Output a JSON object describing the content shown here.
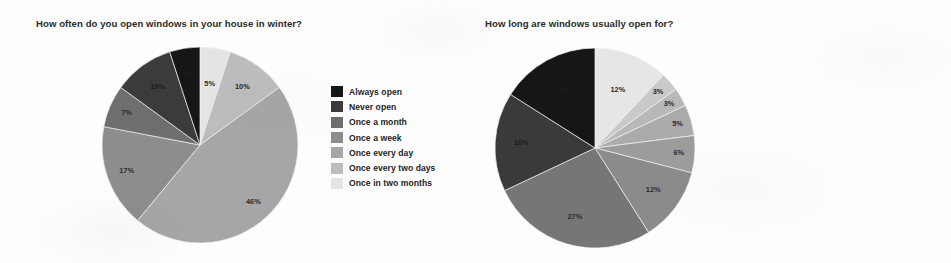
{
  "page": {
    "background_color": "#fdfdfd",
    "text_color": "#242424"
  },
  "charts": [
    {
      "id": "windows-open-frequency",
      "chart_data": {
        "type": "pie",
        "title": "How often do you open windows in your house in winter?",
        "xlabel": "",
        "ylabel": "",
        "legend_position": "right",
        "grid": false,
        "value_suffix": "%",
        "start_angle_deg": 0,
        "direction": "clockwise",
        "categories": [
          "Always open",
          "Never open",
          "Once a month",
          "Once a week",
          "Once every day",
          "Once every two days",
          "Once in two months"
        ],
        "values": [
          5,
          10,
          7,
          17,
          46,
          10,
          5
        ],
        "labels": [
          "5%",
          "10%",
          "7%",
          "17%",
          "46%",
          "10%",
          "5%"
        ],
        "colors": [
          "#161616",
          "#3b3b3b",
          "#6e6e6e",
          "#8d8d8d",
          "#a6a6a6",
          "#bcbcbc",
          "#e4e4e4"
        ],
        "draw_order": [
          {
            "category": "Once in two months",
            "value": 5,
            "label": "5%",
            "color": "#e4e4e4"
          },
          {
            "category": "Once every two days",
            "value": 10,
            "label": "10%",
            "color": "#bcbcbc"
          },
          {
            "category": "Once every day",
            "value": 46,
            "label": "46%",
            "color": "#a6a6a6"
          },
          {
            "category": "Once a week",
            "value": 17,
            "label": "17%",
            "color": "#8d8d8d"
          },
          {
            "category": "Once a month",
            "value": 7,
            "label": "7%",
            "color": "#6e6e6e"
          },
          {
            "category": "Never open",
            "value": 10,
            "label": "10%",
            "color": "#3b3b3b"
          },
          {
            "category": "Always open",
            "value": 5,
            "label": "5%",
            "color": "#161616"
          }
        ]
      }
    },
    {
      "id": "windows-open-duration",
      "chart_data": {
        "type": "pie",
        "title": "How long are windows usually open for?",
        "xlabel": "",
        "ylabel": "",
        "legend_position": "right",
        "grid": false,
        "value_suffix": "%",
        "start_angle_deg": 0,
        "direction": "clockwise",
        "categories": [
          "2-5 hours",
          "30 mins to 1 hour a day",
          "About 30 mins a day",
          "5-15 mins a day",
          "During day time",
          " During evening/night time",
          "Never",
          "More than 5 hours",
          " Less than 5 mins a day"
        ],
        "values": [
          16,
          16,
          27,
          12,
          6,
          5,
          3,
          3,
          12
        ],
        "labels": [
          "16%",
          "16%",
          "27%",
          "12%",
          "6%",
          "5%",
          "3%",
          "3%",
          "12%"
        ],
        "colors": [
          "#161616",
          "#3a3a3a",
          "#767676",
          "#8b8b8b",
          "#9c9c9c",
          "#ababab",
          "#b8b8b8",
          "#c9c9c9",
          "#e6e6e6"
        ],
        "draw_order": [
          {
            "category": " Less than 5 mins a day",
            "value": 12,
            "label": "12%",
            "color": "#e6e6e6"
          },
          {
            "category": "More than 5 hours",
            "value": 3,
            "label": "3%",
            "color": "#c9c9c9"
          },
          {
            "category": "Never",
            "value": 3,
            "label": "3%",
            "color": "#b8b8b8"
          },
          {
            "category": " During evening/night time",
            "value": 5,
            "label": "5%",
            "color": "#ababab"
          },
          {
            "category": "During day time",
            "value": 6,
            "label": "6%",
            "color": "#9c9c9c"
          },
          {
            "category": "5-15 mins a day",
            "value": 12,
            "label": "12%",
            "color": "#8b8b8b"
          },
          {
            "category": "About 30 mins a day",
            "value": 27,
            "label": "27%",
            "color": "#767676"
          },
          {
            "category": "30 mins to 1 hour a day",
            "value": 16,
            "label": "16%",
            "color": "#3a3a3a"
          },
          {
            "category": "2-5 hours",
            "value": 16,
            "label": "16%",
            "color": "#161616"
          }
        ]
      }
    }
  ]
}
